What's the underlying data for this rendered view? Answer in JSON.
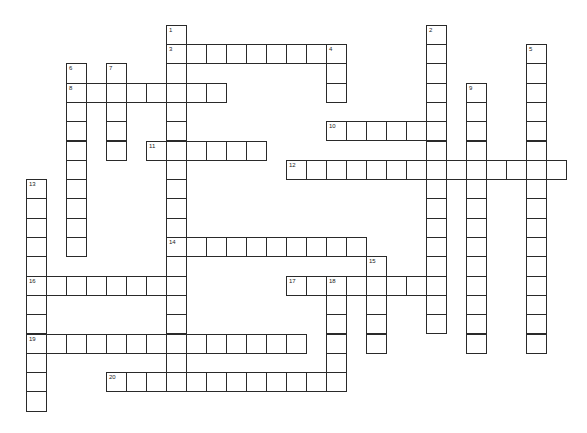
{
  "puzzle": {
    "grid": {
      "origin_x": 26,
      "origin_y": 24.7,
      "cell_w": 20,
      "cell_h": 19.3
    },
    "colors": {
      "border": "#2a2a2a",
      "cell_bg": "#ffffff",
      "number": "#222222"
    },
    "entries": [
      {
        "number": "1",
        "direction": "down",
        "col": 7,
        "row": 0,
        "length": 19
      },
      {
        "number": "2",
        "direction": "down",
        "col": 20,
        "row": 0,
        "length": 16
      },
      {
        "number": "3",
        "direction": "across",
        "col": 7,
        "row": 1,
        "length": 9
      },
      {
        "number": "4",
        "direction": "down",
        "col": 15,
        "row": 1,
        "length": 3
      },
      {
        "number": "5",
        "direction": "down",
        "col": 25,
        "row": 1,
        "length": 16
      },
      {
        "number": "6",
        "direction": "down",
        "col": 2,
        "row": 2,
        "length": 10
      },
      {
        "number": "7",
        "direction": "down",
        "col": 4,
        "row": 2,
        "length": 5
      },
      {
        "number": "8",
        "direction": "across",
        "col": 2,
        "row": 3,
        "length": 8
      },
      {
        "number": "9",
        "direction": "down",
        "col": 22,
        "row": 3,
        "length": 14
      },
      {
        "number": "10",
        "direction": "across",
        "col": 15,
        "row": 5,
        "length": 6
      },
      {
        "number": "11",
        "direction": "across",
        "col": 6,
        "row": 6,
        "length": 6
      },
      {
        "number": "12",
        "direction": "across",
        "col": 13,
        "row": 7,
        "length": 14
      },
      {
        "number": "13",
        "direction": "down",
        "col": 0,
        "row": 8,
        "length": 12
      },
      {
        "number": "14",
        "direction": "across",
        "col": 7,
        "row": 11,
        "length": 10
      },
      {
        "number": "15",
        "direction": "down",
        "col": 17,
        "row": 12,
        "length": 5
      },
      {
        "number": "16",
        "direction": "across",
        "col": 0,
        "row": 13,
        "length": 8
      },
      {
        "number": "17",
        "direction": "across",
        "col": 13,
        "row": 13,
        "length": 8
      },
      {
        "number": "18",
        "direction": "down",
        "col": 15,
        "row": 13,
        "length": 6
      },
      {
        "number": "19",
        "direction": "across",
        "col": 0,
        "row": 16,
        "length": 14
      },
      {
        "number": "20",
        "direction": "across",
        "col": 4,
        "row": 18,
        "length": 12
      }
    ]
  }
}
